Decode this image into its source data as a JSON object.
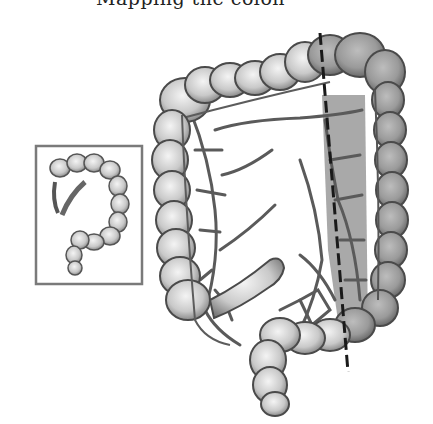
{
  "figure": {
    "caption_fragment": "Mapping the colon",
    "annotations": {
      "resection_line": {
        "style": "dashed",
        "color": "#1a1a1a",
        "from": [
          320,
          33
        ],
        "to": [
          348,
          372
        ]
      },
      "resected_region_shading": "#9a9a9a"
    },
    "inset": {
      "description": "small overview of the whole colon",
      "border_color": "#7a7a7a",
      "box": {
        "x": 35,
        "y": 145,
        "width": 107,
        "height": 139
      }
    },
    "colors": {
      "background": "#ffffff",
      "bowel_light": "#e9e9e9",
      "bowel_mid": "#bdbdbd",
      "bowel_dark": "#6f6f6f",
      "vessel": "#5a5a5a",
      "outline": "#4a4a4a"
    }
  }
}
